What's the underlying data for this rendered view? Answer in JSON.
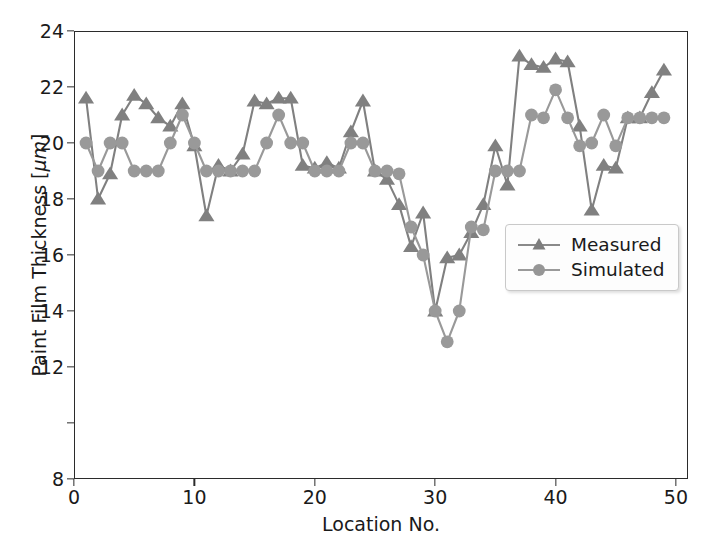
{
  "figure": {
    "background": "#ffffff",
    "axes_color": "#2b2b2b"
  },
  "axis": {
    "xlabel": "Location No.",
    "ylabel_prefix": "Paint Film Thickness [",
    "ylabel_unit": "μm",
    "ylabel_suffix": "]",
    "ylabel_full": "Paint Film Thickness [μm]",
    "xticks": [
      0,
      10,
      20,
      30,
      40,
      50
    ],
    "yticks": [
      8,
      10,
      12,
      14,
      16,
      18,
      20,
      22,
      24
    ],
    "ytick_labels_shown": [
      "8",
      "12",
      "14",
      "16",
      "18",
      "20",
      "22",
      "24"
    ]
  },
  "legend": {
    "position": "center-right",
    "entries": [
      {
        "label": "Measured",
        "marker": "triangle-up",
        "color": "#808080"
      },
      {
        "label": "Simulated",
        "marker": "circle",
        "color": "#999999"
      }
    ]
  },
  "chart_data": {
    "type": "line",
    "title": "",
    "xlabel": "Location No.",
    "ylabel": "Paint Film Thickness [μm]",
    "xlim": [
      0,
      51
    ],
    "ylim": [
      8,
      24
    ],
    "grid": false,
    "legend_position": "center right",
    "x": [
      1,
      2,
      3,
      4,
      5,
      6,
      7,
      8,
      9,
      10,
      11,
      12,
      13,
      14,
      15,
      16,
      17,
      18,
      19,
      20,
      21,
      22,
      23,
      24,
      25,
      26,
      27,
      28,
      29,
      30,
      31,
      32,
      33,
      34,
      35,
      36,
      37,
      38,
      39,
      40,
      41,
      42,
      43,
      44,
      45,
      46,
      47,
      48,
      49
    ],
    "series": [
      {
        "name": "Measured",
        "marker": "triangle-up",
        "color": "#808080",
        "values": [
          21.6,
          18.0,
          18.9,
          21.0,
          21.7,
          21.4,
          20.9,
          20.6,
          21.4,
          19.9,
          17.4,
          19.2,
          19.0,
          19.6,
          21.5,
          21.4,
          21.6,
          21.6,
          19.2,
          19.1,
          19.3,
          19.1,
          20.4,
          21.5,
          19.0,
          18.7,
          17.8,
          16.3,
          17.5,
          14.0,
          15.9,
          16.0,
          16.8,
          17.8,
          19.9,
          18.5,
          23.1,
          22.8,
          22.7,
          23.0,
          22.9,
          20.6,
          17.6,
          19.2,
          19.1,
          20.9,
          20.9,
          21.8,
          22.6
        ]
      },
      {
        "name": "Simulated",
        "marker": "circle",
        "color": "#999999",
        "values": [
          20.0,
          19.0,
          20.0,
          20.0,
          19.0,
          19.0,
          19.0,
          20.0,
          21.0,
          20.0,
          19.0,
          19.0,
          19.0,
          19.0,
          19.0,
          20.0,
          21.0,
          20.0,
          20.0,
          19.0,
          19.0,
          19.0,
          20.0,
          20.0,
          19.0,
          19.0,
          18.9,
          17.0,
          16.0,
          14.0,
          12.9,
          14.0,
          17.0,
          16.9,
          19.0,
          19.0,
          19.0,
          21.0,
          20.9,
          21.9,
          20.9,
          19.9,
          20.0,
          21.0,
          19.9,
          20.9,
          20.9,
          20.9,
          20.9
        ]
      }
    ]
  }
}
